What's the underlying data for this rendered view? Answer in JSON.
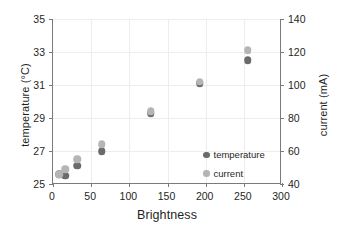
{
  "chart_data": {
    "type": "scatter",
    "title": "",
    "xlabel": "Brightness",
    "ylabel": "temperature (°C)",
    "y2label": "current (mA)",
    "xlim": [
      0,
      300
    ],
    "ylim": [
      25,
      35
    ],
    "y2lim": [
      40,
      140
    ],
    "xticks": [
      0,
      50,
      100,
      150,
      200,
      250,
      300
    ],
    "yticks": [
      25,
      27,
      29,
      31,
      33,
      35
    ],
    "y2ticks": [
      40,
      60,
      80,
      100,
      120,
      140
    ],
    "grid": true,
    "legend_position": "inside-lower-right",
    "x": [
      8,
      16,
      32,
      64,
      128,
      192,
      255
    ],
    "series": [
      {
        "name": "temperature",
        "axis": "left",
        "color": "#6b6b6b",
        "marker": "circle",
        "values": [
          25.6,
          25.5,
          26.1,
          27.0,
          29.3,
          31.1,
          32.5
        ]
      },
      {
        "name": "current",
        "axis": "right",
        "color": "#b5b5b5",
        "marker": "circle",
        "values": [
          46,
          49,
          55,
          64,
          84,
          102,
          121
        ]
      }
    ],
    "legend": [
      "temperature",
      "current"
    ]
  }
}
